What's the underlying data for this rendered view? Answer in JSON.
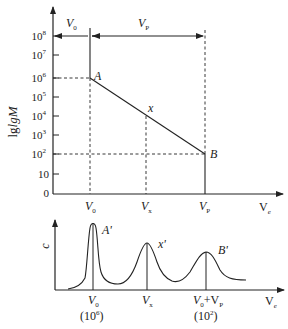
{
  "diagram": {
    "top_plot": {
      "y_axis_label": "lgM",
      "y_ticks": [
        {
          "label": "10",
          "sup": "8",
          "y": 36
        },
        {
          "label": "10",
          "sup": "7",
          "y": 55
        },
        {
          "label": "10",
          "sup": "6",
          "y": 78
        },
        {
          "label": "10",
          "sup": "5",
          "y": 97
        },
        {
          "label": "10",
          "sup": "4",
          "y": 116
        },
        {
          "label": "10",
          "sup": "3",
          "y": 135
        },
        {
          "label": "10",
          "sup": "2",
          "y": 154
        },
        {
          "label": "10",
          "sup": "",
          "y": 174
        },
        {
          "label": "0",
          "sup": "",
          "y": 193
        }
      ],
      "x_ticks": [
        {
          "label": "V",
          "sub": "0"
        },
        {
          "label": "V",
          "sub": "x"
        },
        {
          "label": "V",
          "sub": "P"
        }
      ],
      "x_axis_label": {
        "main": "V",
        "sub": "e"
      },
      "span_labels": {
        "v0": {
          "main": "V",
          "sub": "0"
        },
        "vp": {
          "main": "V",
          "sub": "P"
        }
      },
      "points": {
        "A": "A",
        "x": "x",
        "B": "B"
      }
    },
    "bottom_plot": {
      "y_axis_label": "c",
      "x_axis_label": {
        "main": "V",
        "sub": "e"
      },
      "peaks": [
        {
          "label": "A'",
          "x_label": "V",
          "x_sub": "0",
          "note": "(10",
          "note_sup": "6",
          "note_end": ")"
        },
        {
          "label": "x'",
          "x_label": "V",
          "x_sub": "x"
        },
        {
          "label": "B'",
          "x_label": "V",
          "x_sub": "0",
          "x_extra": "+V",
          "x_extra_sub": "P",
          "note": "(10",
          "note_sup": "2",
          "note_end": ")"
        }
      ]
    }
  }
}
